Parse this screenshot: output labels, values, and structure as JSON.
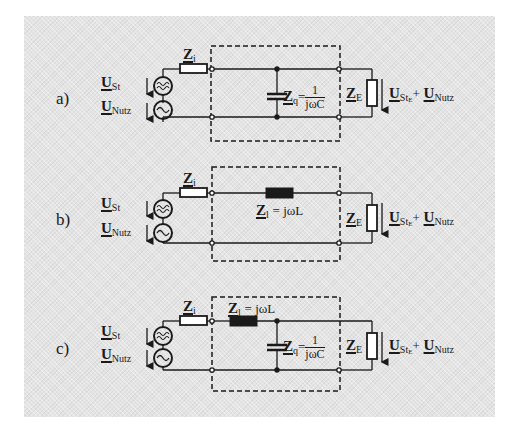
{
  "figure": {
    "background_color": "#e4e4e4",
    "line_color": "#1a1a1a",
    "variants": [
      {
        "id": "a",
        "case_label": "a)",
        "source": {
          "u_st_symbol": "U",
          "u_st_sub": "St",
          "u_nutz_symbol": "U",
          "u_nutz_sub": "Nutz",
          "noise_source_icon": "≋",
          "useful_source_icon": "~"
        },
        "internal_impedance": {
          "symbol": "Z",
          "sub": "i"
        },
        "filter": {
          "type": "shunt-capacitor",
          "zq_symbol": "Z",
          "zq_sub": "q",
          "zq_eq": "=",
          "zq_num": "1",
          "zq_den": "jωC"
        },
        "load": {
          "symbol": "Z",
          "sub": "E",
          "u_out_symbol": "U",
          "u_out_sub": "St",
          "u_out_subsub": "E",
          "plus": "+",
          "u_out2_symbol": "U",
          "u_out2_sub": "Nutz"
        }
      },
      {
        "id": "b",
        "case_label": "b)",
        "source": {
          "u_st_symbol": "U",
          "u_st_sub": "St",
          "u_nutz_symbol": "U",
          "u_nutz_sub": "Nutz",
          "noise_source_icon": "≋",
          "useful_source_icon": "~"
        },
        "internal_impedance": {
          "symbol": "Z",
          "sub": "i"
        },
        "filter": {
          "type": "series-inductor",
          "zl_symbol": "Z",
          "zl_sub": "l",
          "zl_eq": "= jωL"
        },
        "load": {
          "symbol": "Z",
          "sub": "E",
          "u_out_symbol": "U",
          "u_out_sub": "St",
          "u_out_subsub": "E",
          "plus": "+",
          "u_out2_symbol": "U",
          "u_out2_sub": "Nutz"
        }
      },
      {
        "id": "c",
        "case_label": "c)",
        "source": {
          "u_st_symbol": "U",
          "u_st_sub": "St",
          "u_nutz_symbol": "U",
          "u_nutz_sub": "Nutz",
          "noise_source_icon": "≋",
          "useful_source_icon": "~"
        },
        "internal_impedance": {
          "symbol": "Z",
          "sub": "i"
        },
        "filter": {
          "type": "L-section",
          "zl_symbol": "Z",
          "zl_sub": "l",
          "zl_eq": "= jωL",
          "zq_symbol": "Z",
          "zq_sub": "q",
          "zq_eq": "=",
          "zq_num": "1",
          "zq_den": "jωC"
        },
        "load": {
          "symbol": "Z",
          "sub": "E",
          "u_out_symbol": "U",
          "u_out_sub": "St",
          "u_out_subsub": "E",
          "plus": "+",
          "u_out2_symbol": "U",
          "u_out2_sub": "Nutz"
        }
      }
    ]
  }
}
